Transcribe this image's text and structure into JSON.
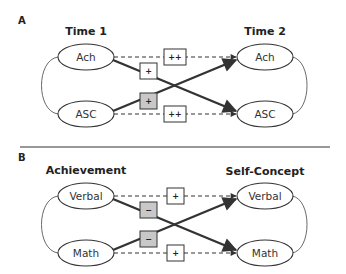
{
  "colors": {
    "stroke": "#333333",
    "gray_box": "#c8c8c8",
    "white_box": "#ffffff"
  },
  "panels": [
    {
      "label": "A",
      "left_header": "Time 1",
      "right_header": "Time 2",
      "left_nodes": [
        "Ach",
        "ASC"
      ],
      "right_nodes": [
        "Ach",
        "ASC"
      ],
      "paths": {
        "top_straight": {
          "sign": "++",
          "style": "dashed",
          "box": "white"
        },
        "bottom_straight": {
          "sign": "++",
          "style": "dashed",
          "box": "white"
        },
        "top_to_bottom_cross": {
          "sign": "+",
          "style": "bold",
          "box": "white"
        },
        "bottom_to_top_cross": {
          "sign": "+",
          "style": "bold",
          "box": "gray"
        }
      }
    },
    {
      "label": "B",
      "left_header": "Achievement",
      "right_header": "Self-Concept",
      "left_nodes": [
        "Verbal",
        "Math"
      ],
      "right_nodes": [
        "Verbal",
        "Math"
      ],
      "paths": {
        "top_straight": {
          "sign": "+",
          "style": "dashed",
          "box": "white"
        },
        "bottom_straight": {
          "sign": "+",
          "style": "dashed",
          "box": "white"
        },
        "top_to_bottom_cross": {
          "sign": "−",
          "style": "bold",
          "box": "gray"
        },
        "bottom_to_top_cross": {
          "sign": "−",
          "style": "bold",
          "box": "gray"
        }
      }
    }
  ]
}
